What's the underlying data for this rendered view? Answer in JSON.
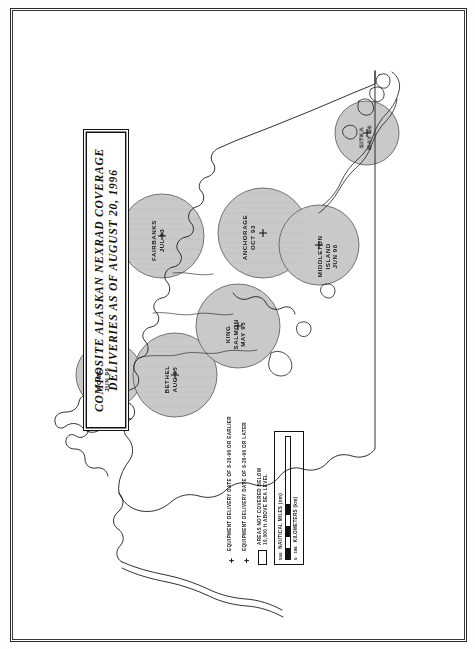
{
  "document": {
    "title_line_1": "COMPOSITE ALASKAN NEXRAD COVERAGE",
    "title_line_2": "DELIVERIES AS OF AUGUST 20, 1996"
  },
  "map": {
    "region": "Alaska",
    "background_color": "#ffffff",
    "coverage_fill_color": "#c9c9c9",
    "outline_color": "#1a1a1a",
    "stations": [
      {
        "id": "nome",
        "name": "NOME",
        "date": "JUN 96",
        "x": 86,
        "y": 352,
        "r": 33,
        "label_x": 80,
        "label_y": 356
      },
      {
        "id": "bethel",
        "name": "BETHEL",
        "date": "AUG 95",
        "x": 152,
        "y": 352,
        "r": 42,
        "label_x": 148,
        "label_y": 356
      },
      {
        "id": "king-salmon",
        "name": "KING\nSALMON",
        "date": "MAY 95",
        "x": 215,
        "y": 303,
        "r": 42,
        "label_x": 205,
        "label_y": 312
      },
      {
        "id": "fairbanks",
        "name": "FAIRBANKS",
        "date": "JUL 93",
        "x": 139,
        "y": 213,
        "r": 42,
        "label_x": 132,
        "label_y": 218
      },
      {
        "id": "anchorage",
        "name": "ANCHORAGE",
        "date": "OCT 93",
        "x": 240,
        "y": 210,
        "r": 45,
        "label_x": 222,
        "label_y": 210
      },
      {
        "id": "middleton",
        "name": "MIDDLETON\nISLAND",
        "date": "JUN 96",
        "x": 296,
        "y": 222,
        "r": 40,
        "label_x": 300,
        "label_y": 228
      },
      {
        "id": "sitka",
        "name": "SITKA",
        "date": "MAY 96",
        "x": 344,
        "y": 110,
        "r": 32,
        "label_x": 336,
        "label_y": 112
      }
    ]
  },
  "legend": {
    "items": [
      {
        "symbol": "+",
        "type": "marker",
        "text_line_1": "EQUIPMENT DELIVERY DATE OF 8-20-96 OR EARLIER"
      },
      {
        "symbol": "+",
        "type": "marker",
        "text_line_1": "EQUIPMENT DELIVERY DATE OF 8-20-96 OR LATER"
      },
      {
        "symbol": "",
        "type": "swatch",
        "text_line_1": "AREAS NOT COVERED BELOW",
        "text_line_2": "10,000 ft ABOVE SEA LEVEL"
      }
    ],
    "scale": {
      "nautical_miles_label": "NAUTICAL MILES (nm)",
      "nautical_miles_start": "0",
      "nautical_miles_end": "500",
      "kilometers_label": "KILOMETERS (km)",
      "kilometers_start": "0",
      "kilometers_end": "186"
    }
  }
}
